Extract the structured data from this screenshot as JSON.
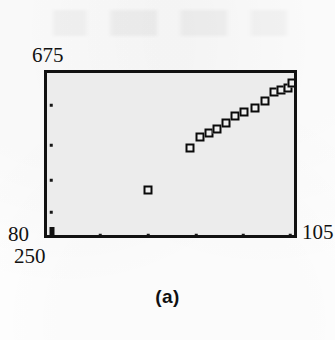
{
  "figure": {
    "caption": "(a)",
    "background_color": "#fdfdfd",
    "plot_fill_color": "#ececec",
    "frame_color": "#111111",
    "marker_color": "#0a0a0a"
  },
  "axes": {
    "y_max_label": "675",
    "y_min_label": "80",
    "x_min_label": "250",
    "x_max_label": "105"
  },
  "chart_data": {
    "type": "scatter",
    "title": "(a)",
    "xlabel": "",
    "ylabel": "",
    "xlim": [
      250,
      105
    ],
    "ylim": [
      80,
      675
    ],
    "grid": false,
    "legend": null,
    "marker_style": "open-square",
    "x_tick_labels": [
      "250",
      "105"
    ],
    "y_tick_labels": [
      "80",
      "675"
    ],
    "note": "Reversed x-axis: left edge = 250, right edge = 105. Points form a rising diagonal band in the upper right, with one isolated low outlier near the centre-left.",
    "points": [
      {
        "x": 192.0,
        "y": 380.0
      },
      {
        "x": 186.0,
        "y": 417.0
      },
      {
        "x": 181.0,
        "y": 432.0
      },
      {
        "x": 176.0,
        "y": 445.0
      },
      {
        "x": 170.0,
        "y": 468.0
      },
      {
        "x": 164.0,
        "y": 490.0
      },
      {
        "x": 158.0,
        "y": 503.0
      },
      {
        "x": 151.0,
        "y": 518.0
      },
      {
        "x": 144.0,
        "y": 540.0
      },
      {
        "x": 132.0,
        "y": 572.0
      },
      {
        "x": 128.0,
        "y": 578.0
      },
      {
        "x": 120.0,
        "y": 585.0
      },
      {
        "x": 113.0,
        "y": 600.0
      },
      {
        "x": 206.0,
        "y": 230.0
      }
    ],
    "pixel_points": [
      {
        "px": 190,
        "py": 148
      },
      {
        "px": 200,
        "py": 137
      },
      {
        "px": 209,
        "py": 133
      },
      {
        "px": 217,
        "py": 129
      },
      {
        "px": 226,
        "py": 123
      },
      {
        "px": 235,
        "py": 116
      },
      {
        "px": 244,
        "py": 112
      },
      {
        "px": 255,
        "py": 108
      },
      {
        "px": 265,
        "py": 101
      },
      {
        "px": 274,
        "py": 92
      },
      {
        "px": 281,
        "py": 90
      },
      {
        "px": 288,
        "py": 88
      },
      {
        "px": 292,
        "py": 83
      },
      {
        "px": 148,
        "py": 190
      }
    ],
    "left_edge_tick_pixels": [
      105,
      145,
      180,
      212
    ],
    "bottom_edge_tick_pixels": [
      100,
      148,
      196,
      243,
      290
    ]
  }
}
